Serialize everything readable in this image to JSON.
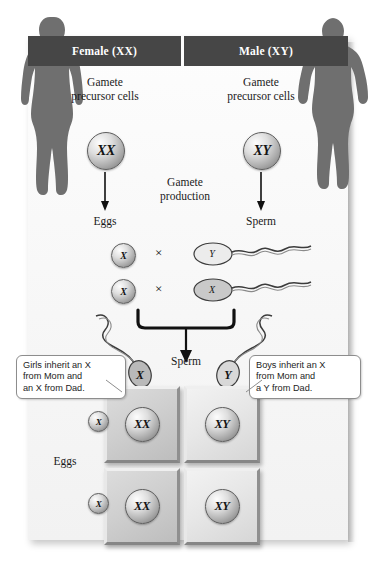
{
  "diagram": {
    "columns": [
      {
        "header": "Female (XX)",
        "precursor_label": "Gamete\nprecursor cells",
        "genotype": "XX",
        "gamete_label": "Eggs"
      },
      {
        "header": "Male (XY)",
        "precursor_label": "Gamete\nprecursor cells",
        "genotype": "XY",
        "gamete_label": "Sperm"
      }
    ],
    "headers": {
      "female": "Female (XX)",
      "male": "Male (XY)"
    },
    "precursor": {
      "line1": "Gamete",
      "line2": "precursor cells"
    },
    "precursor_cells": {
      "female_genotype": "XX",
      "male_genotype": "XY"
    },
    "production": {
      "line1": "Gamete",
      "line2": "production"
    },
    "gamete_labels": {
      "eggs": "Eggs",
      "sperm": "Sperm"
    },
    "crosses": [
      {
        "egg": "X",
        "operator": "×",
        "sperm": "Y"
      },
      {
        "egg": "X",
        "operator": "×",
        "sperm": "X"
      }
    ],
    "cross_symbol": "×",
    "fusion": {
      "sperm_label": "Sperm",
      "sperm_left": "X",
      "sperm_right": "Y"
    },
    "punnett": {
      "row_axis_label": "Eggs",
      "row_gametes": [
        "X",
        "X"
      ],
      "cells": [
        [
          "XX",
          "XY"
        ],
        [
          "XX",
          "XY"
        ]
      ]
    },
    "callouts": {
      "left": {
        "line1": "Girls inherit an X",
        "line2": "from Mom and",
        "line3": "an X from Dad."
      },
      "right": {
        "line1": "Boys inherit an X",
        "line2": "from Mom and",
        "line3": "a Y from Dad."
      }
    },
    "colors": {
      "header_bar": "#464646",
      "header_text": "#ffffff",
      "panel_bg": "#f7f7f7",
      "silhouette": "#6f6f6f",
      "cell_fill": "#cfcfcf",
      "ink": "#141414"
    }
  }
}
